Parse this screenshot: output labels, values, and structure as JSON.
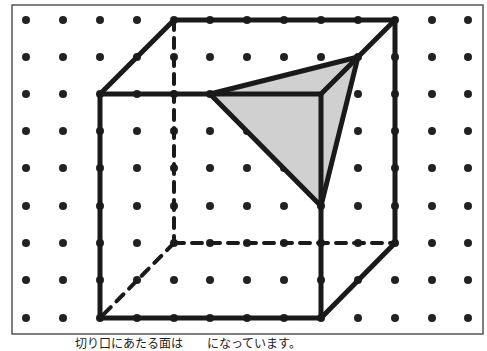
{
  "figure": {
    "frame": {
      "x": 12,
      "y": 5,
      "w": 471,
      "h": 329
    },
    "grid": {
      "xs": [
        26,
        63,
        100,
        137,
        174,
        210,
        247,
        284,
        321,
        358,
        395,
        432,
        468
      ],
      "ys": [
        20,
        57,
        94,
        131,
        168,
        206,
        243,
        280,
        318
      ],
      "dot_radius": 4
    },
    "cube": {
      "solid_edges": [
        [
          [
            100,
            94
          ],
          [
            321,
            94
          ]
        ],
        [
          [
            321,
            94
          ],
          [
            321,
            318
          ]
        ],
        [
          [
            321,
            318
          ],
          [
            100,
            318
          ]
        ],
        [
          [
            100,
            318
          ],
          [
            100,
            94
          ]
        ],
        [
          [
            100,
            94
          ],
          [
            174,
            20
          ]
        ],
        [
          [
            174,
            20
          ],
          [
            395,
            20
          ]
        ],
        [
          [
            395,
            20
          ],
          [
            321,
            94
          ]
        ],
        [
          [
            395,
            20
          ],
          [
            395,
            243
          ]
        ],
        [
          [
            395,
            243
          ],
          [
            321,
            318
          ]
        ]
      ],
      "dashed_edges": [
        [
          [
            174,
            20
          ],
          [
            174,
            243
          ]
        ],
        [
          [
            174,
            243
          ],
          [
            395,
            243
          ]
        ],
        [
          [
            174,
            243
          ],
          [
            100,
            318
          ]
        ]
      ]
    },
    "cross_section": {
      "vertices": [
        [
          210,
          94
        ],
        [
          358,
          57
        ],
        [
          321,
          206
        ]
      ],
      "fill": "#d0d0d0"
    },
    "colors": {
      "line": "#1a1a1a",
      "dot": "#222222",
      "frame": "#555555"
    }
  },
  "caption": {
    "text": "切り口にあたる面は　　になっています。"
  }
}
